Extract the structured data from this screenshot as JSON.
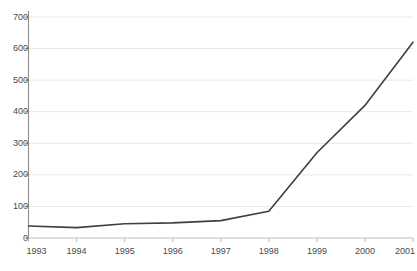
{
  "chart_data": {
    "type": "line",
    "title": "",
    "subtitle": "",
    "xlabel": "",
    "ylabel": "",
    "categories": [
      "1993",
      "1994",
      "1995",
      "1996",
      "1997",
      "1998",
      "1999",
      "2000",
      "2001"
    ],
    "x": [
      1993,
      1994,
      1995,
      1996,
      1997,
      1998,
      1999,
      2000,
      2001
    ],
    "values": [
      38,
      33,
      45,
      48,
      55,
      85,
      270,
      420,
      620
    ],
    "series": [
      {
        "name": "",
        "values": [
          38,
          33,
          45,
          48,
          55,
          85,
          270,
          420,
          620
        ]
      }
    ],
    "ylim": [
      0,
      700
    ],
    "xlim": [
      1993,
      2001
    ],
    "yticks": [
      0,
      100,
      200,
      300,
      400,
      500,
      600,
      700
    ],
    "ytick_labels": [
      "0",
      "100",
      "200",
      "300",
      "400",
      "500",
      "600",
      "700"
    ],
    "xticks": [
      1993,
      1994,
      1995,
      1996,
      1997,
      1998,
      1999,
      2000,
      2001
    ],
    "xtick_labels": [
      "1993",
      "1994",
      "1995",
      "1996",
      "1997",
      "1998",
      "1999",
      "2000",
      "2001"
    ],
    "grid": true,
    "grid_axis": "y",
    "legend": false,
    "legend_position": "none",
    "annotations": [],
    "colors": {
      "line": "#3f3f3f",
      "grid": "#e8e8e8",
      "axis": "#9a9a9a",
      "tick_label": "#4a4a4a",
      "background": "#ffffff"
    },
    "line_width": 1.6
  }
}
